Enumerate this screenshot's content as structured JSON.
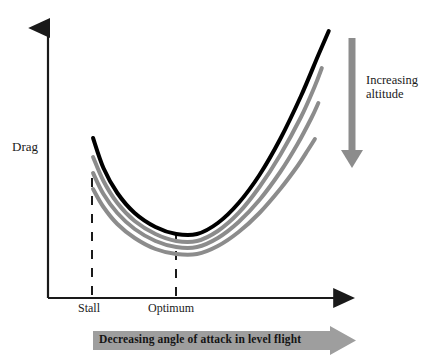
{
  "figure": {
    "background_color": "#ffffff"
  },
  "axes": {
    "y_label": "Drag",
    "x_ticks": [
      {
        "label": "Stall"
      },
      {
        "label": "Optimum"
      }
    ],
    "axis_color": "#1a1a1a"
  },
  "annotations": {
    "altitude": "Increasing\naltitude",
    "altitude_line1": "Increasing",
    "altitude_line2": "altitude",
    "banner": "Decreasing angle of attack in level flight",
    "arrow_color": "#8c8c8c",
    "banner_color": "#9e9e9e"
  },
  "chart_data": {
    "type": "line",
    "xlabel": "Decreasing angle of attack in level flight",
    "ylabel": "Drag",
    "grid": false,
    "legend": "none",
    "xlim": [
      0,
      1
    ],
    "ylim": [
      0,
      1
    ],
    "xtick_labels": [
      "Stall",
      "Optimum"
    ],
    "xtick_positions": [
      0.14,
      0.41
    ],
    "annotations": [
      {
        "text": "Increasing altitude",
        "direction": "down",
        "meaning": "curves lower on plot correspond to increasing altitude"
      },
      {
        "text": "Decreasing angle of attack in level flight",
        "direction": "right"
      }
    ],
    "series": [
      {
        "name": "lowest altitude",
        "color": "#000000",
        "width": 4,
        "points": [
          [
            0.1477,
            0.5714
          ],
          [
            0.1818,
            0.4643
          ],
          [
            0.2273,
            0.375
          ],
          [
            0.2841,
            0.3036
          ],
          [
            0.3523,
            0.2536
          ],
          [
            0.4205,
            0.2286
          ],
          [
            0.4886,
            0.2286
          ],
          [
            0.5568,
            0.2679
          ],
          [
            0.625,
            0.3393
          ],
          [
            0.6932,
            0.4393
          ],
          [
            0.7614,
            0.5679
          ],
          [
            0.8295,
            0.7214
          ],
          [
            0.8864,
            0.8679
          ],
          [
            0.9205,
            0.9536
          ]
        ]
      },
      {
        "name": "altitude 2",
        "color": "#8c8c8c",
        "width": 4,
        "points": [
          [
            0.1477,
            0.5036
          ],
          [
            0.1818,
            0.4179
          ],
          [
            0.2273,
            0.3393
          ],
          [
            0.2841,
            0.275
          ],
          [
            0.3523,
            0.2286
          ],
          [
            0.4205,
            0.2036
          ],
          [
            0.4886,
            0.2036
          ],
          [
            0.5568,
            0.2393
          ],
          [
            0.625,
            0.3036
          ],
          [
            0.6932,
            0.3964
          ],
          [
            0.7614,
            0.5107
          ],
          [
            0.8295,
            0.6464
          ],
          [
            0.875,
            0.7571
          ],
          [
            0.8977,
            0.8214
          ]
        ]
      },
      {
        "name": "altitude 3",
        "color": "#8c8c8c",
        "width": 4,
        "points": [
          [
            0.1477,
            0.4464
          ],
          [
            0.1818,
            0.3714
          ],
          [
            0.2273,
            0.3036
          ],
          [
            0.2841,
            0.2464
          ],
          [
            0.3523,
            0.2036
          ],
          [
            0.4205,
            0.1821
          ],
          [
            0.4886,
            0.1821
          ],
          [
            0.5568,
            0.2143
          ],
          [
            0.625,
            0.2714
          ],
          [
            0.6932,
            0.35
          ],
          [
            0.7614,
            0.45
          ],
          [
            0.8182,
            0.55
          ],
          [
            0.8636,
            0.6429
          ],
          [
            0.8864,
            0.6964
          ]
        ]
      },
      {
        "name": "highest altitude",
        "color": "#8c8c8c",
        "width": 4,
        "points": [
          [
            0.1477,
            0.3893
          ],
          [
            0.1818,
            0.325
          ],
          [
            0.2273,
            0.2643
          ],
          [
            0.2841,
            0.2143
          ],
          [
            0.3523,
            0.175
          ],
          [
            0.4205,
            0.1571
          ],
          [
            0.4886,
            0.1571
          ],
          [
            0.5568,
            0.1857
          ],
          [
            0.625,
            0.2357
          ],
          [
            0.6932,
            0.3036
          ],
          [
            0.7614,
            0.3893
          ],
          [
            0.8182,
            0.4714
          ],
          [
            0.8523,
            0.5286
          ],
          [
            0.875,
            0.5679
          ]
        ]
      }
    ]
  }
}
